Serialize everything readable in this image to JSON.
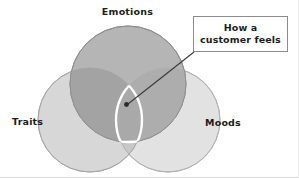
{
  "diagram": {
    "type": "venn",
    "title": "",
    "sets": [
      {
        "id": "emotions",
        "label": "Emotions",
        "position": "top",
        "fill": "#b5b5b5",
        "stroke": "#8a8a8a",
        "cx": 128,
        "cy": 84,
        "r": 58
      },
      {
        "id": "traits",
        "label": "Traits",
        "position": "bottom-left",
        "fill": "#d5d5d5",
        "stroke": "#a8a8a8",
        "cx": 90,
        "cy": 120,
        "r": 52
      },
      {
        "id": "moods",
        "label": "Moods",
        "position": "bottom-right",
        "fill": "#e2e2e2",
        "stroke": "#b4b4b4",
        "cx": 168,
        "cy": 120,
        "r": 52
      }
    ],
    "intersection": {
      "id": "triple-intersection",
      "outline_color": "#ffffff",
      "marker": {
        "x": 126,
        "y": 104,
        "color": "#2b2b2b"
      }
    },
    "callout": {
      "text": "How a\ncustomer feels",
      "border_color": "#8c8c8c",
      "background": "#ffffff",
      "leader_line": {
        "from": {
          "x": 194,
          "y": 52
        },
        "to": {
          "x": 127,
          "y": 104
        },
        "color": "#3a3a3a"
      }
    }
  }
}
